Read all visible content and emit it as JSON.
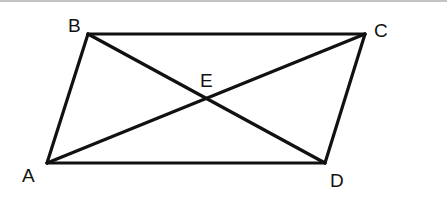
{
  "figure": {
    "type": "parallelogram-with-diagonals",
    "stroke_color": "#111111",
    "top_border_color": "#8a8a8a",
    "points": {
      "A": {
        "label": "A",
        "x": 47,
        "y": 163,
        "label_x": 22,
        "label_y": 182
      },
      "B": {
        "label": "B",
        "x": 88,
        "y": 34,
        "label_x": 68,
        "label_y": 32
      },
      "C": {
        "label": "C",
        "x": 365,
        "y": 34,
        "label_x": 374,
        "label_y": 37
      },
      "D": {
        "label": "D",
        "x": 325,
        "y": 163,
        "label_x": 330,
        "label_y": 187
      },
      "E": {
        "label": "E",
        "x": 206,
        "y": 98,
        "label_x": 200,
        "label_y": 87
      }
    },
    "segments": [
      {
        "name": "AB",
        "from": "A",
        "to": "B"
      },
      {
        "name": "BC",
        "from": "B",
        "to": "C"
      },
      {
        "name": "CD",
        "from": "C",
        "to": "D"
      },
      {
        "name": "DA",
        "from": "D",
        "to": "A"
      },
      {
        "name": "AC",
        "from": "A",
        "to": "C"
      },
      {
        "name": "BD",
        "from": "B",
        "to": "D"
      }
    ]
  }
}
